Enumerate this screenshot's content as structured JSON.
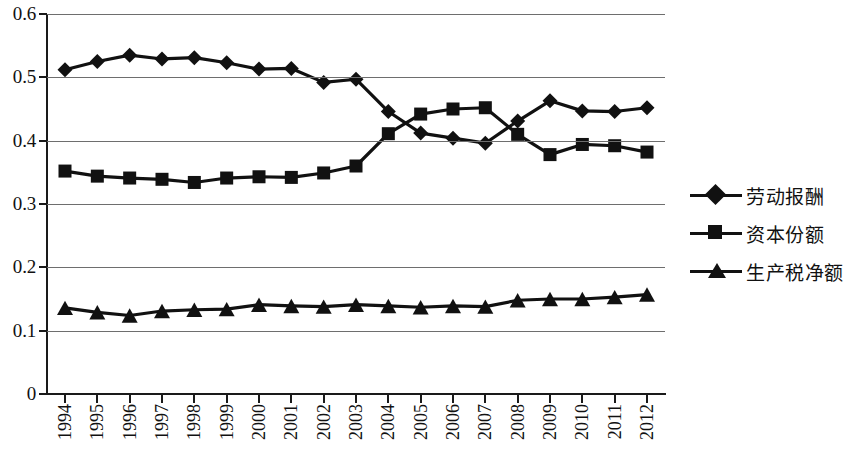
{
  "chart_data": {
    "type": "line",
    "title": "",
    "xlabel": "",
    "ylabel": "",
    "ylim": [
      0,
      0.6
    ],
    "ytick_labels": [
      "0.6",
      "0.5",
      "0.4",
      "0.3",
      "0.2",
      "0.1",
      "0"
    ],
    "ytick_values": [
      0.6,
      0.5,
      0.4,
      0.3,
      0.2,
      0.1,
      0
    ],
    "grid": true,
    "legend_position": "right",
    "categories": [
      "1994",
      "1995",
      "1996",
      "1997",
      "1998",
      "1999",
      "2000",
      "2001",
      "2002",
      "2003",
      "2004",
      "2005",
      "2006",
      "2007",
      "2008",
      "2009",
      "2010",
      "2011",
      "2012"
    ],
    "series": [
      {
        "name": "劳动报酬",
        "marker": "diamond",
        "values": [
          0.512,
          0.525,
          0.535,
          0.529,
          0.531,
          0.523,
          0.513,
          0.514,
          0.492,
          0.497,
          0.446,
          0.412,
          0.404,
          0.396,
          0.431,
          0.463,
          0.447,
          0.446,
          0.452
        ]
      },
      {
        "name": "资本份额",
        "marker": "square",
        "values": [
          0.352,
          0.344,
          0.341,
          0.339,
          0.334,
          0.341,
          0.343,
          0.342,
          0.349,
          0.36,
          0.411,
          0.442,
          0.45,
          0.452,
          0.41,
          0.378,
          0.394,
          0.392,
          0.382
        ]
      },
      {
        "name": "生产税净额",
        "marker": "triangle",
        "values": [
          0.136,
          0.129,
          0.124,
          0.131,
          0.133,
          0.134,
          0.141,
          0.139,
          0.138,
          0.141,
          0.139,
          0.137,
          0.139,
          0.138,
          0.148,
          0.15,
          0.15,
          0.153,
          0.157
        ]
      }
    ],
    "colors": {
      "series": "#111111",
      "axis": "#1a1a1a",
      "grid": "#6e6e6e",
      "background": "#ffffff"
    }
  },
  "legend": {
    "items": [
      {
        "label": "劳动报酬",
        "marker": "diamond-marker"
      },
      {
        "label": "资本份额",
        "marker": "square-marker"
      },
      {
        "label": "生产税净额",
        "marker": "triangle-marker"
      }
    ]
  }
}
